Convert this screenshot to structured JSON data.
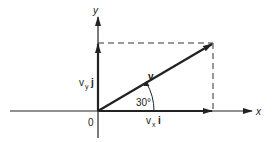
{
  "diagram": {
    "colors": {
      "ink": "#222222",
      "background": "#ffffff"
    },
    "axes": {
      "x_label": "x",
      "y_label": "y",
      "origin_label": "0"
    },
    "vector": {
      "label": "v",
      "angle_label": "30°"
    },
    "components": {
      "x_label": "v",
      "x_sub": "x",
      "x_unit": "i",
      "y_label": "v",
      "y_sub": "y",
      "y_unit": "j"
    }
  }
}
